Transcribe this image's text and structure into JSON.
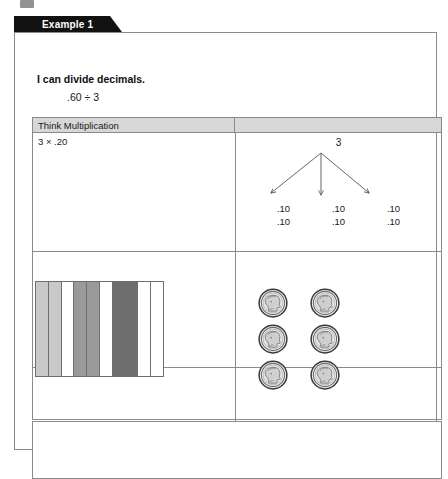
{
  "page": {
    "tab_label": "Example 1",
    "objective": "I can divide decimals.",
    "expression": ".60 ÷ 3"
  },
  "table": {
    "headers": [
      "Think Multiplication",
      ""
    ],
    "left_cell_top": "3 × .20"
  },
  "tree_diagram": {
    "root": "3",
    "branch_count": 3,
    "leaves": [
      [
        ".10",
        ".10"
      ],
      [
        ".10",
        ".10"
      ],
      [
        ".10",
        ".10"
      ]
    ]
  },
  "grid_model": {
    "columns": 10,
    "shades": [
      "#c9c9c9",
      "#c9c9c9",
      "#ffffff",
      "#9a9a9a",
      "#9a9a9a",
      "#ffffff",
      "#6e6e6e",
      "#6e6e6e",
      "#ffffff",
      "#ffffff"
    ]
  },
  "coins": {
    "label": "dime-coin",
    "count": 6,
    "rows": 3,
    "columns": 2
  },
  "colors": {
    "tab_background": "#111111",
    "tab_text": "#ffffff",
    "header_background": "#d7d7d7",
    "border": "#8a8a8a",
    "text": "#1a1a1a"
  }
}
